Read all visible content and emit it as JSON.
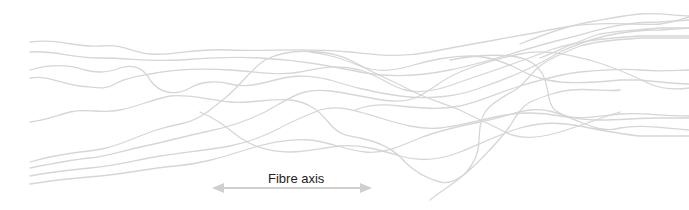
{
  "diagram": {
    "type": "schematic",
    "fibre_color": "#d6d6d6",
    "axis": {
      "label": "Fibre axis",
      "arrow": "double-headed",
      "arrow_color": "#cfcfcf"
    },
    "fibre_count": 16
  }
}
